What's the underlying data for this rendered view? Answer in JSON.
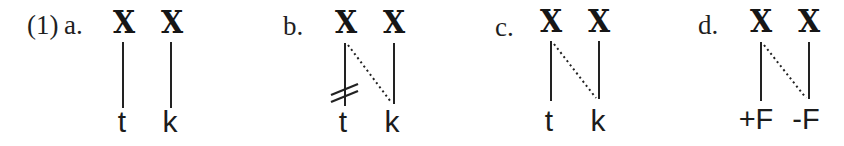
{
  "figure": {
    "number": "(1)",
    "ink_color": "#1f1f1f",
    "background_color": "#ffffff",
    "panels": [
      {
        "label": "a.",
        "timing_slots": [
          "X",
          "X"
        ],
        "segments": [
          "t",
          "k"
        ],
        "associations": [
          {
            "slot": 1,
            "segment": "t",
            "style": "solid"
          },
          {
            "slot": 2,
            "segment": "k",
            "style": "solid"
          }
        ]
      },
      {
        "label": "b.",
        "timing_slots": [
          "X",
          "X"
        ],
        "segments": [
          "t",
          "k"
        ],
        "associations": [
          {
            "slot": 1,
            "segment": "t",
            "style": "solid",
            "delinked": true
          },
          {
            "slot": 1,
            "segment": "k",
            "style": "dotted"
          },
          {
            "slot": 2,
            "segment": "k",
            "style": "solid"
          }
        ]
      },
      {
        "label": "c.",
        "timing_slots": [
          "X",
          "X"
        ],
        "segments": [
          "t",
          "k"
        ],
        "associations": [
          {
            "slot": 1,
            "segment": "t",
            "style": "solid"
          },
          {
            "slot": 1,
            "segment": "k",
            "style": "dotted"
          },
          {
            "slot": 2,
            "segment": "k",
            "style": "solid"
          }
        ]
      },
      {
        "label": "d.",
        "timing_slots": [
          "X",
          "X"
        ],
        "segments": [
          "+F",
          "-F"
        ],
        "associations": [
          {
            "slot": 1,
            "segment": "+F",
            "style": "solid"
          },
          {
            "slot": 1,
            "segment": "-F",
            "style": "dotted"
          },
          {
            "slot": 2,
            "segment": "-F",
            "style": "solid"
          }
        ]
      }
    ]
  }
}
